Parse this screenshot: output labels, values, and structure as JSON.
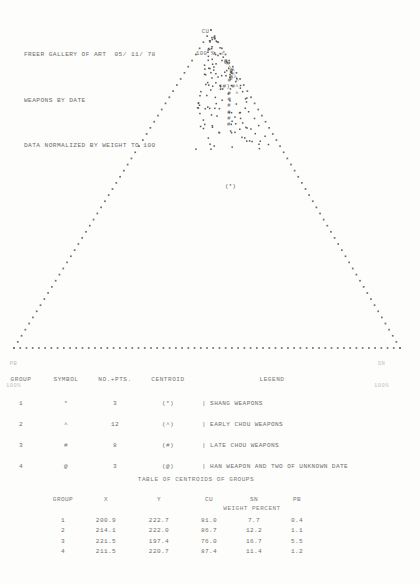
{
  "header": {
    "line1": "FREER GALLERY OF ART  05/ 11/ 78",
    "line2": "WEAPONS BY DATE",
    "line3": "DATA NORMALIZED BY WEIGHT TO 100"
  },
  "plot": {
    "apex_label_top": "CU",
    "apex_label_bottom": "100 %",
    "left_corner_label_top": "PB",
    "left_corner_label_bottom": "100%",
    "right_corner_label_top": "SN",
    "right_corner_label_bottom": "100%",
    "centroid_tag_group3": "(#)",
    "centroid_tag_group1": "(*)"
  },
  "legend": {
    "headers": [
      "GROUP",
      "SYMBOL",
      "NO.+PTS.",
      "CENTROID",
      "LEGEND"
    ],
    "rows": [
      {
        "group": "1",
        "symbol": "*",
        "points": "3",
        "centroid": "(*)",
        "legend": "| SHANG WEAPONS"
      },
      {
        "group": "2",
        "symbol": "^",
        "points": "12",
        "centroid": "(^)",
        "legend": "| EARLY CHOU WEAPONS"
      },
      {
        "group": "3",
        "symbol": "#",
        "points": "8",
        "centroid": "(#)",
        "legend": "| LATE CHOU WEAPONS"
      },
      {
        "group": "4",
        "symbol": "@",
        "points": "3",
        "centroid": "(@)",
        "legend": "| HAN WEAPON AND TWO OF UNKNOWN DATE"
      }
    ]
  },
  "centroid_table": {
    "title": "TABLE OF CENTROIDS OF GROUPS",
    "headers": [
      "GROUP",
      "X",
      "Y",
      "CU",
      "SN",
      "PB"
    ],
    "subheader": "WEIGHT PERCENT",
    "rows": [
      {
        "group": "1",
        "x": "200.9",
        "y": "222.7",
        "cu": "81.0",
        "sn": "7.7",
        "pb": "0.4"
      },
      {
        "group": "2",
        "x": "214.1",
        "y": "222.0",
        "cu": "86.7",
        "sn": "12.2",
        "pb": "1.1"
      },
      {
        "group": "3",
        "x": "221.5",
        "y": "197.4",
        "cu": "76.0",
        "sn": "16.7",
        "pb": "5.5"
      },
      {
        "group": "4",
        "x": "211.5",
        "y": "220.7",
        "cu": "87.4",
        "sn": "11.4",
        "pb": "1.2"
      }
    ]
  },
  "chart_data": {
    "type": "scatter",
    "subtype": "ternary",
    "title": "FREER GALLERY OF ART  05/ 11/ 78",
    "subtitle": "WEAPONS BY DATE",
    "note": "DATA NORMALIZED BY WEIGHT TO 100",
    "axes": {
      "top": "CU 100 %",
      "left": "PB 100%",
      "right": "SN 100%"
    },
    "grid": false,
    "legend_position": "below-plot",
    "series": [
      {
        "name": "SHANG WEAPONS",
        "symbol": "*",
        "count": 3,
        "centroid": {
          "cu": 81.0,
          "sn": 7.7,
          "pb": 0.4,
          "x": 200.9,
          "y": 222.7
        },
        "points": [
          {
            "cu": 89.0,
            "sn": 7.0,
            "pb": 0.3
          },
          {
            "cu": 77.0,
            "sn": 9.0,
            "pb": 0.5
          },
          {
            "cu": 60.0,
            "sn": 7.0,
            "pb": 0.4
          }
        ]
      },
      {
        "name": "EARLY CHOU WEAPONS",
        "symbol": "^",
        "count": 12,
        "centroid": {
          "cu": 86.7,
          "sn": 12.2,
          "pb": 1.1,
          "x": 214.1,
          "y": 222.0
        },
        "points": [
          {
            "cu": 92.0,
            "sn": 7.0,
            "pb": 1.0
          },
          {
            "cu": 90.0,
            "sn": 9.0,
            "pb": 1.0
          },
          {
            "cu": 89.0,
            "sn": 10.0,
            "pb": 1.0
          },
          {
            "cu": 88.0,
            "sn": 11.0,
            "pb": 1.0
          },
          {
            "cu": 87.0,
            "sn": 12.0,
            "pb": 1.0
          },
          {
            "cu": 87.0,
            "sn": 12.5,
            "pb": 0.5
          },
          {
            "cu": 86.0,
            "sn": 13.0,
            "pb": 1.0
          },
          {
            "cu": 85.0,
            "sn": 14.0,
            "pb": 1.0
          },
          {
            "cu": 85.0,
            "sn": 13.0,
            "pb": 2.0
          },
          {
            "cu": 84.0,
            "sn": 15.0,
            "pb": 1.0
          },
          {
            "cu": 82.0,
            "sn": 16.0,
            "pb": 2.0
          },
          {
            "cu": 80.0,
            "sn": 17.0,
            "pb": 3.0
          }
        ]
      },
      {
        "name": "LATE CHOU WEAPONS",
        "symbol": "#",
        "count": 8,
        "centroid": {
          "cu": 76.0,
          "sn": 16.7,
          "pb": 5.5,
          "x": 221.5,
          "y": 197.4
        },
        "points": [
          {
            "cu": 84.0,
            "sn": 13.0,
            "pb": 3.0
          },
          {
            "cu": 82.0,
            "sn": 15.0,
            "pb": 3.0
          },
          {
            "cu": 80.0,
            "sn": 15.0,
            "pb": 5.0
          },
          {
            "cu": 78.0,
            "sn": 16.0,
            "pb": 6.0
          },
          {
            "cu": 76.0,
            "sn": 17.0,
            "pb": 7.0
          },
          {
            "cu": 74.0,
            "sn": 18.0,
            "pb": 8.0
          },
          {
            "cu": 72.0,
            "sn": 19.0,
            "pb": 9.0
          },
          {
            "cu": 70.0,
            "sn": 20.0,
            "pb": 10.0
          }
        ]
      },
      {
        "name": "HAN WEAPON AND TWO OF UNKNOWN DATE",
        "symbol": "@",
        "count": 3,
        "centroid": {
          "cu": 87.4,
          "sn": 11.4,
          "pb": 1.2,
          "x": 211.5,
          "y": 220.7
        },
        "points": [
          {
            "cu": 90.0,
            "sn": 9.0,
            "pb": 1.0
          },
          {
            "cu": 87.0,
            "sn": 12.0,
            "pb": 1.0
          },
          {
            "cu": 85.0,
            "sn": 13.0,
            "pb": 2.0
          }
        ]
      }
    ]
  }
}
